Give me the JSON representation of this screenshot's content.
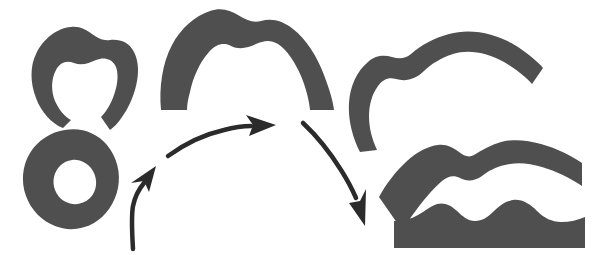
{
  "figure": {
    "title": "Shape deformation sequence diagram",
    "background_color": "#ffffff",
    "shape_color": "#4f4f4f",
    "arrow_color": "#2b2b2b",
    "width": 595,
    "height": 255
  },
  "shapes": [
    {
      "id": "omega-horseshoe",
      "label": "Horseshoe shape with open bottom gap",
      "group": "left-column",
      "position": "top-left"
    },
    {
      "id": "donut-blob",
      "label": "Closed blob with circular hole",
      "group": "left-column",
      "position": "bottom-left"
    },
    {
      "id": "arch-band",
      "label": "Arch shaped band with wavy top",
      "group": "center-column",
      "position": "top-center"
    },
    {
      "id": "hook-band",
      "label": "Hook shaped curved band",
      "group": "right-column",
      "position": "top-right"
    },
    {
      "id": "wavy-band",
      "label": "Shallow curved band with two crests",
      "group": "right-column",
      "position": "middle-right"
    },
    {
      "id": "flat-bar",
      "label": "Flat bar with two bumps on top",
      "group": "right-column",
      "position": "bottom-right"
    }
  ],
  "arrows": [
    {
      "id": "arrow-up-left",
      "label": "Curved arrow pointing up-left to center",
      "direction": "up-left"
    },
    {
      "id": "arrow-right-top",
      "label": "Curved arrow pointing right across the top",
      "direction": "right"
    },
    {
      "id": "arrow-down-right",
      "label": "Curved arrow pointing down-right",
      "direction": "down-right"
    }
  ]
}
